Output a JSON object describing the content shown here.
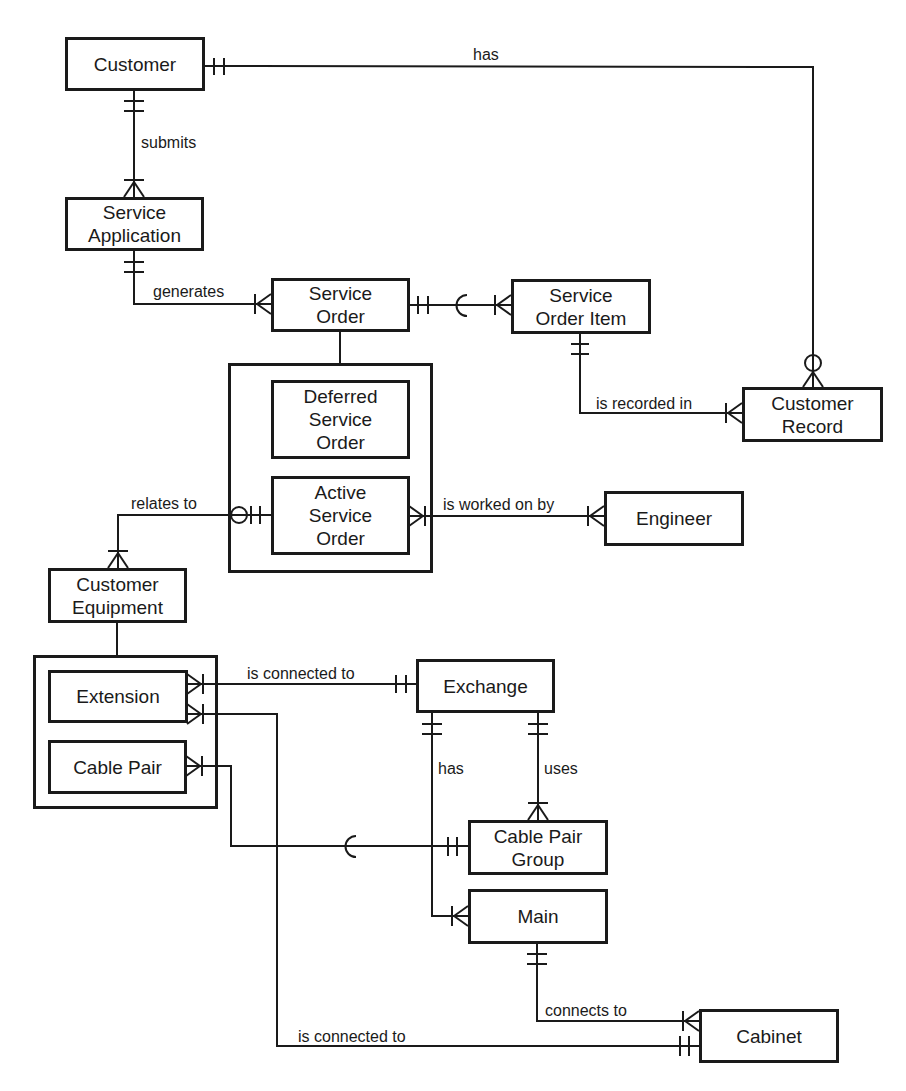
{
  "diagram": {
    "type": "entity-relationship",
    "notation": "crows-foot",
    "entities": {
      "customer": "Customer",
      "service_application": "Service\nApplication",
      "service_order": "Service\nOrder",
      "service_order_item": "Service\nOrder Item",
      "customer_record": "Customer\nRecord",
      "deferred_service_order": "Deferred\nService\nOrder",
      "active_service_order": "Active\nService\nOrder",
      "engineer": "Engineer",
      "customer_equipment": "Customer\nEquipment",
      "extension": "Extension",
      "cable_pair": "Cable Pair",
      "exchange": "Exchange",
      "cable_pair_group": "Cable Pair\nGroup",
      "main": "Main",
      "cabinet": "Cabinet"
    },
    "relationships": [
      {
        "id": "r1",
        "label": "has",
        "from": "Customer",
        "to": "Customer Record",
        "from_card": "one-and-only-one",
        "to_card": "zero-or-many"
      },
      {
        "id": "r2",
        "label": "submits",
        "from": "Customer",
        "to": "Service Application",
        "from_card": "one-and-only-one",
        "to_card": "one-or-many"
      },
      {
        "id": "r3",
        "label": "generates",
        "from": "Service Application",
        "to": "Service Order",
        "from_card": "one-and-only-one",
        "to_card": "one-or-many"
      },
      {
        "id": "r4",
        "label": "",
        "from": "Service Order",
        "to": "Service Order Item",
        "from_card": "one-and-only-one",
        "to_card": "one-or-many"
      },
      {
        "id": "r5",
        "label": "is recorded in",
        "from": "Service Order Item",
        "to": "Customer Record",
        "from_card": "one-and-only-one",
        "to_card": "one-or-many"
      },
      {
        "id": "r6",
        "label": "relates to",
        "from": "Active Service Order",
        "to": "Customer Equipment",
        "from_card": "zero-or-one",
        "to_card": "one-or-many"
      },
      {
        "id": "r7",
        "label": "is worked on by",
        "from": "Active Service Order",
        "to": "Engineer",
        "from_card": "one-or-many",
        "to_card": "one-or-many"
      },
      {
        "id": "r8",
        "label": "is connected to",
        "from": "Extension",
        "to": "Exchange",
        "from_card": "one-or-many",
        "to_card": "one-and-only-one"
      },
      {
        "id": "r9",
        "label": "has",
        "from": "Exchange",
        "to": "Main",
        "from_card": "one-and-only-one",
        "to_card": "one-or-many"
      },
      {
        "id": "r10",
        "label": "uses",
        "from": "Exchange",
        "to": "Cable Pair Group",
        "from_card": "one-and-only-one",
        "to_card": "one-or-many"
      },
      {
        "id": "r11",
        "label": "",
        "from": "Cable Pair",
        "to": "Cable Pair Group",
        "from_card": "one-or-many",
        "to_card": "one-and-only-one"
      },
      {
        "id": "r12",
        "label": "connects to",
        "from": "Main",
        "to": "Cabinet",
        "from_card": "one-and-only-one",
        "to_card": "one-or-many"
      },
      {
        "id": "r13",
        "label": "is connected to",
        "from": "Extension",
        "to": "Cabinet",
        "from_card": "one-or-many",
        "to_card": "one-and-only-one"
      }
    ],
    "labels": {
      "has_top": "has",
      "submits": "submits",
      "generates": "generates",
      "is_recorded_in": "is recorded in",
      "relates_to": "relates to",
      "is_worked_on_by": "is worked on by",
      "is_connected_to_top": "is connected to",
      "has_exchange": "has",
      "uses": "uses",
      "connects_to": "connects to",
      "is_connected_to_bottom": "is connected to"
    },
    "colors": {
      "ink": "#1a1a1a",
      "background": "#ffffff"
    }
  }
}
